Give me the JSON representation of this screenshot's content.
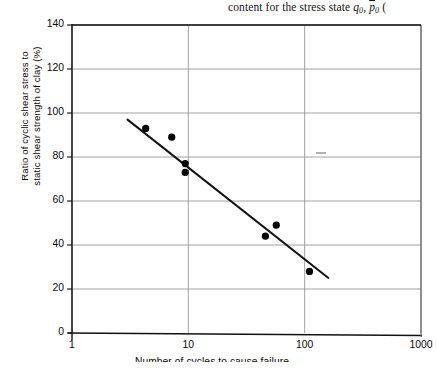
{
  "page": {
    "header_running_text": "content for the stress state q0, p0 (",
    "header_parts": {
      "lead": "content for the stress state",
      "var1": "q",
      "var1_sub": "0",
      "comma": ",",
      "var2": "p",
      "var2_sub": "0",
      "trailing": "("
    }
  },
  "chart_data": {
    "type": "scatter",
    "title": "",
    "xlabel": "Number of cycles to cause failure",
    "ylabel": "Ratio of cyclic shear stress to static shear strength of clay (%)",
    "ylabel_line1": "Ratio of cyclic shear stress to",
    "ylabel_line2": "static shear strength of clay (%)",
    "xscale": "log",
    "yscale": "linear",
    "xlim": [
      1,
      1000
    ],
    "ylim": [
      0,
      140
    ],
    "xticks": [
      1,
      10,
      100,
      1000
    ],
    "xtick_labels": [
      "1",
      "10",
      "100",
      "1000"
    ],
    "yticks": [
      0,
      20,
      40,
      60,
      80,
      100,
      120,
      140
    ],
    "ytick_labels": [
      "0",
      "20",
      "40",
      "60",
      "80",
      "100",
      "120",
      "140"
    ],
    "grid": "both",
    "legend": "none",
    "series": [
      {
        "name": "Cyclic test data",
        "marker": "filled-circle",
        "color": "#000000",
        "points": [
          {
            "x": 4.3,
            "y": 93
          },
          {
            "x": 7.2,
            "y": 89
          },
          {
            "x": 9.4,
            "y": 77
          },
          {
            "x": 9.4,
            "y": 73
          },
          {
            "x": 46,
            "y": 44
          },
          {
            "x": 57,
            "y": 49
          },
          {
            "x": 110,
            "y": 28
          }
        ]
      },
      {
        "name": "Best-fit trend line",
        "marker": "line",
        "color": "#111111",
        "line_endpoints": [
          {
            "x": 3.0,
            "y": 97
          },
          {
            "x": 160,
            "y": 25
          }
        ]
      }
    ]
  },
  "icons": {
    "data_point": "filled-circle-marker"
  }
}
